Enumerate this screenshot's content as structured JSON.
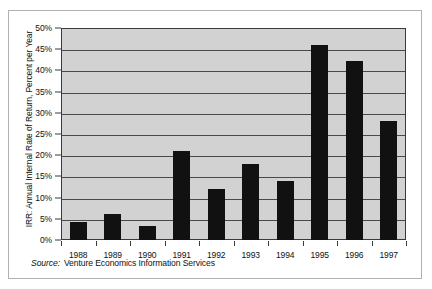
{
  "chart_data": {
    "type": "bar",
    "title": "",
    "xlabel": "",
    "ylabel": "IRR: Annual Internal Rate of Return, Percent per Year",
    "categories": [
      "1988",
      "1989",
      "1990",
      "1991",
      "1992",
      "1993",
      "1994",
      "1995",
      "1996",
      "1997"
    ],
    "values": [
      4.3,
      6.1,
      3.2,
      20.9,
      12.0,
      18.0,
      14.0,
      46.0,
      42.2,
      28.1
    ],
    "ylim": [
      0,
      50
    ],
    "ytick_values": [
      0,
      5,
      10,
      15,
      20,
      25,
      30,
      35,
      40,
      45,
      50
    ],
    "ytick_labels": [
      "0%",
      "5%",
      "10%",
      "15%",
      "20%",
      "25%",
      "30%",
      "35%",
      "40%",
      "45%",
      "50%"
    ],
    "grid": true,
    "legend": "none",
    "bar_color": "#111111",
    "plot_background": "#d2d2d2",
    "gridline_color": "#4a4a4a",
    "axis_color": "#3a3a3a"
  },
  "source": {
    "label": "Source:",
    "text": "Venture Economics Information Services"
  }
}
